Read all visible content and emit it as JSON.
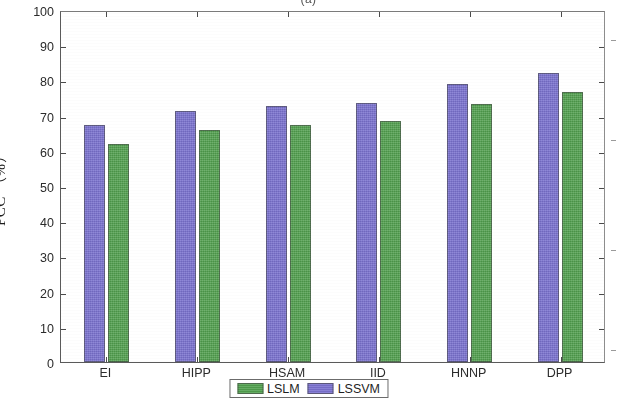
{
  "figure": {
    "caption_top": "(a)"
  },
  "chart_data": {
    "type": "bar",
    "title": "(a)",
    "xlabel": "",
    "ylabel": "PCC （%）",
    "categories": [
      "EI",
      "HIPP",
      "HSAM",
      "IID",
      "HNNP",
      "DPP"
    ],
    "series": [
      {
        "name": "LSLM",
        "color": "#51a04e",
        "values": [
          62.0,
          65.8,
          67.3,
          68.4,
          73.4,
          76.8
        ]
      },
      {
        "name": "LSSVM",
        "color": "#7b72d0",
        "values": [
          67.3,
          71.4,
          72.6,
          73.7,
          79.0,
          82.2
        ]
      }
    ],
    "series_draw_order": [
      "LSSVM",
      "LSLM"
    ],
    "ylim": [
      0,
      100
    ],
    "ytick_step": 10,
    "yticks": [
      "100",
      "90",
      "80",
      "70",
      "60",
      "50",
      "40",
      "30",
      "20",
      "10",
      "0"
    ],
    "grid": false,
    "legend_position": "bottom-center",
    "legend_entries": [
      "LSLM",
      "LSSVM"
    ]
  }
}
